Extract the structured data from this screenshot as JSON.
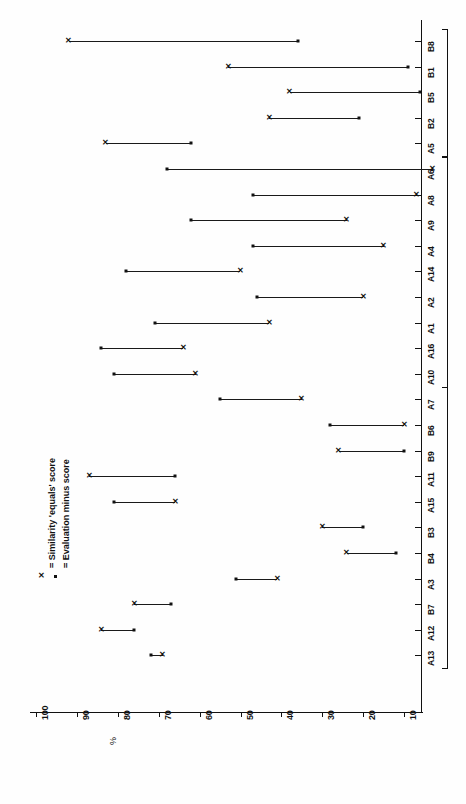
{
  "chart_data": {
    "type": "scatter",
    "title": "",
    "subtitle": "",
    "xlabel": "%",
    "ylabel": "",
    "orientation": "rotated-90",
    "grid": false,
    "legend_position": "inner-left",
    "axis": {
      "name": "%",
      "ticks": [
        100,
        90,
        80,
        70,
        60,
        50,
        40,
        30,
        20,
        10
      ],
      "tick_labels": [
        "100",
        "90",
        "80",
        "70",
        "60",
        "50",
        "40",
        "30",
        "20",
        "10"
      ],
      "range": [
        100,
        5
      ],
      "direction": "descending"
    },
    "legend": [
      {
        "marker": "x",
        "symbol": "×",
        "label": "= Similarity 'equals' score"
      },
      {
        "marker": "dot",
        "symbol": "•",
        "label": "= Evaluation minus score"
      }
    ],
    "series": [
      {
        "name": "Similarity 'equals' score",
        "marker": "x"
      },
      {
        "name": "Evaluation minus score",
        "marker": "dot"
      }
    ],
    "categories": [
      "B8",
      "B1",
      "B5",
      "B2",
      "A5",
      "A6",
      "A8",
      "A9",
      "A4",
      "A14",
      "A2",
      "A1",
      "A16",
      "A10",
      "A7",
      "B6",
      "B9",
      "A11",
      "A15",
      "B3",
      "B4",
      "A3",
      "B7",
      "A12",
      "A13"
    ],
    "points": [
      {
        "category": "B8",
        "similarity": 92,
        "evaluation": 36
      },
      {
        "category": "B1",
        "similarity": 53,
        "evaluation": 9
      },
      {
        "category": "B5",
        "similarity": 38,
        "evaluation": 6
      },
      {
        "category": "B2",
        "similarity": 43,
        "evaluation": 21
      },
      {
        "category": "A5",
        "similarity": 83,
        "evaluation": 62
      },
      {
        "category": "A6",
        "similarity": 3,
        "evaluation": 68
      },
      {
        "category": "A8",
        "similarity": 7,
        "evaluation": 47
      },
      {
        "category": "A9",
        "similarity": 24,
        "evaluation": 62
      },
      {
        "category": "A4",
        "similarity": 15,
        "evaluation": 47
      },
      {
        "category": "A14",
        "similarity": 50,
        "evaluation": 78
      },
      {
        "category": "A2",
        "similarity": 20,
        "evaluation": 46
      },
      {
        "category": "A1",
        "similarity": 43,
        "evaluation": 71
      },
      {
        "category": "A16",
        "similarity": 64,
        "evaluation": 84
      },
      {
        "category": "A10",
        "similarity": 61,
        "evaluation": 81
      },
      {
        "category": "A7",
        "similarity": 35,
        "evaluation": 55
      },
      {
        "category": "B6",
        "similarity": 10,
        "evaluation": 28
      },
      {
        "category": "B9",
        "similarity": 26,
        "evaluation": 10
      },
      {
        "category": "A11",
        "similarity": 87,
        "evaluation": 66
      },
      {
        "category": "A15",
        "similarity": 66,
        "evaluation": 81
      },
      {
        "category": "B3",
        "similarity": 30,
        "evaluation": 20
      },
      {
        "category": "B4",
        "similarity": 24,
        "evaluation": 12
      },
      {
        "category": "A3",
        "similarity": 41,
        "evaluation": 51
      },
      {
        "category": "B7",
        "similarity": 76,
        "evaluation": 67
      },
      {
        "category": "A12",
        "similarity": 84,
        "evaluation": 76
      },
      {
        "category": "A13",
        "similarity": 69,
        "evaluation": 72
      }
    ],
    "groups": [
      {
        "label": "",
        "from": "B8",
        "to": "A5"
      },
      {
        "label": "",
        "from": "A6",
        "to": "A10"
      },
      {
        "label": "",
        "from": "A7",
        "to": "A13"
      }
    ]
  }
}
